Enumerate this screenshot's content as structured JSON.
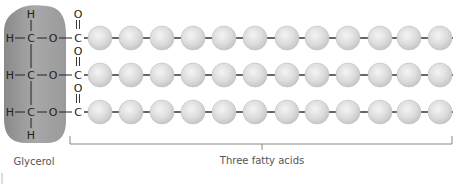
{
  "diagram": {
    "glycerol": {
      "label": "Glycerol",
      "rows": [
        {
          "top_h": "H",
          "left_h": "H",
          "carbon": "C",
          "oxygen": "O"
        },
        {
          "left_h": "H",
          "carbon": "C",
          "oxygen": "O"
        },
        {
          "left_h": "H",
          "carbon": "C",
          "oxygen": "O",
          "bottom_h": "H"
        }
      ],
      "fill_color": "#9a9a9a"
    },
    "fatty_acids": {
      "label": "Three fatty acids",
      "count": 3,
      "carbonyl": {
        "carbon": "C",
        "oxygen": "O"
      },
      "balls_per_chain": 12,
      "ball_color": "#dcdcdc",
      "bond_color": "#333333"
    }
  }
}
